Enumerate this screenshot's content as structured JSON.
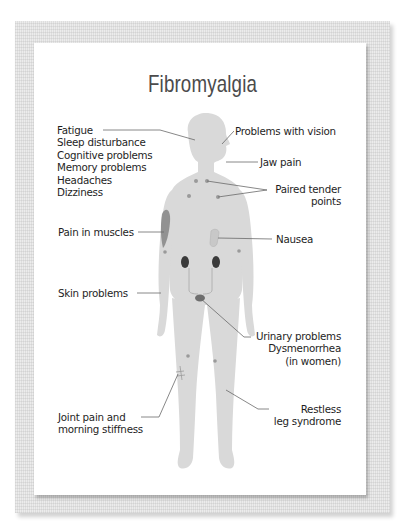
{
  "title": "Fibromyalgia",
  "colors": {
    "body": "#d9d9d9",
    "organs": "#3a3a3a",
    "leader_lines": "#6a6a6a",
    "title_text": "#4b4b4b",
    "frame": "#ececec"
  },
  "labels": {
    "head_symptoms": [
      "Fatigue",
      "Sleep disturbance",
      "Cognitive problems",
      "Memory problems",
      "Headaches",
      "Dizziness"
    ],
    "vision": "Problems with vision",
    "jaw": "Jaw pain",
    "tender_points": [
      "Paired tender",
      "points"
    ],
    "muscles": "Pain in muscles",
    "nausea": "Nausea",
    "skin": "Skin problems",
    "urinary": [
      "Urinary problems",
      "Dysmenorrhea",
      "(in women)"
    ],
    "joint": [
      "Joint pain and",
      "morning stiffness"
    ],
    "restless_leg": [
      "Restless",
      "leg syndrome"
    ]
  }
}
